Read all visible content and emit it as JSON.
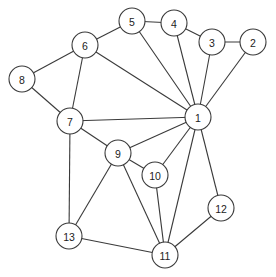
{
  "diagram": {
    "type": "undirected-graph",
    "node_radius": 13,
    "colors": {
      "stroke": "#3a3a3a",
      "fill": "#ffffff",
      "label": "#222222",
      "background": "#ffffff"
    },
    "nodes": [
      {
        "id": "1",
        "label": "1",
        "x": 198,
        "y": 117
      },
      {
        "id": "2",
        "label": "2",
        "x": 253,
        "y": 42
      },
      {
        "id": "3",
        "label": "3",
        "x": 212,
        "y": 42
      },
      {
        "id": "4",
        "label": "4",
        "x": 174,
        "y": 23
      },
      {
        "id": "5",
        "label": "5",
        "x": 132,
        "y": 21
      },
      {
        "id": "6",
        "label": "6",
        "x": 85,
        "y": 45
      },
      {
        "id": "7",
        "label": "7",
        "x": 70,
        "y": 121
      },
      {
        "id": "8",
        "label": "8",
        "x": 22,
        "y": 79
      },
      {
        "id": "9",
        "label": "9",
        "x": 118,
        "y": 153
      },
      {
        "id": "10",
        "label": "10",
        "x": 155,
        "y": 175
      },
      {
        "id": "11",
        "label": "11",
        "x": 165,
        "y": 255
      },
      {
        "id": "12",
        "label": "12",
        "x": 221,
        "y": 208
      },
      {
        "id": "13",
        "label": "13",
        "x": 69,
        "y": 236
      }
    ],
    "edges": [
      [
        "5",
        "6"
      ],
      [
        "5",
        "4"
      ],
      [
        "4",
        "3"
      ],
      [
        "3",
        "2"
      ],
      [
        "6",
        "8"
      ],
      [
        "6",
        "7"
      ],
      [
        "6",
        "1"
      ],
      [
        "8",
        "7"
      ],
      [
        "5",
        "1"
      ],
      [
        "4",
        "1"
      ],
      [
        "3",
        "1"
      ],
      [
        "2",
        "1"
      ],
      [
        "7",
        "1"
      ],
      [
        "7",
        "9"
      ],
      [
        "9",
        "1"
      ],
      [
        "9",
        "10"
      ],
      [
        "10",
        "1"
      ],
      [
        "7",
        "13"
      ],
      [
        "9",
        "13"
      ],
      [
        "9",
        "11"
      ],
      [
        "10",
        "11"
      ],
      [
        "1",
        "11"
      ],
      [
        "1",
        "12"
      ],
      [
        "12",
        "11"
      ],
      [
        "13",
        "11"
      ]
    ]
  }
}
